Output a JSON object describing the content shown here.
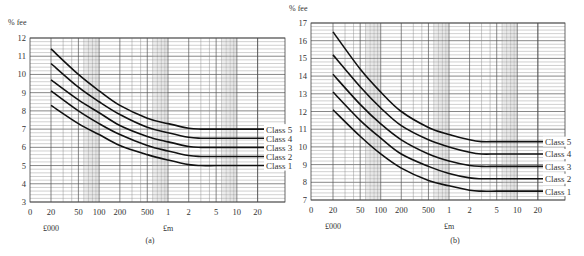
{
  "chart_data": [
    {
      "type": "line",
      "panel_label": "(a)",
      "ylabel": "% fee",
      "xlabel_left": "£000",
      "xlabel_right": "£m",
      "x_scale": "log",
      "x_ticks": [
        "0",
        "20",
        "50",
        "100",
        "200",
        "500",
        "1",
        "2",
        "5",
        "10",
        "20"
      ],
      "x_values_gbp": [
        0,
        20000,
        50000,
        100000,
        200000,
        500000,
        1000000,
        2000000,
        5000000,
        10000000,
        20000000
      ],
      "ylim": [
        3,
        12
      ],
      "y_ticks": [
        3,
        4,
        5,
        6,
        7,
        8,
        9,
        10,
        11,
        12
      ],
      "grid": true,
      "legend_position": "right, inline labels",
      "x": [
        20000,
        50000,
        100000,
        200000,
        500000,
        1000000,
        2000000,
        3000000,
        5000000,
        10000000
      ],
      "series": [
        {
          "name": "Class 5",
          "values": [
            11.4,
            10.0,
            9.1,
            8.3,
            7.6,
            7.3,
            7.05,
            7.0,
            7.0,
            7.0
          ]
        },
        {
          "name": "Class 4",
          "values": [
            10.6,
            9.3,
            8.5,
            7.8,
            7.1,
            6.8,
            6.55,
            6.5,
            6.5,
            6.5
          ]
        },
        {
          "name": "Class 3",
          "values": [
            9.7,
            8.6,
            7.9,
            7.2,
            6.6,
            6.3,
            6.05,
            6.0,
            6.0,
            6.0
          ]
        },
        {
          "name": "Class 2",
          "values": [
            9.1,
            8.0,
            7.3,
            6.7,
            6.1,
            5.8,
            5.55,
            5.5,
            5.5,
            5.5
          ]
        },
        {
          "name": "Class 1",
          "values": [
            8.3,
            7.3,
            6.7,
            6.1,
            5.6,
            5.3,
            5.05,
            5.0,
            5.0,
            5.0
          ]
        }
      ]
    },
    {
      "type": "line",
      "panel_label": "(b)",
      "ylabel": "% fee",
      "xlabel_left": "£000",
      "xlabel_right": "£m",
      "x_scale": "log",
      "x_ticks": [
        "0",
        "20",
        "50",
        "100",
        "200",
        "500",
        "1",
        "2",
        "5",
        "10",
        "20"
      ],
      "x_values_gbp": [
        0,
        20000,
        50000,
        100000,
        200000,
        500000,
        1000000,
        2000000,
        5000000,
        10000000,
        20000000
      ],
      "ylim": [
        7,
        17
      ],
      "y_ticks": [
        7,
        8,
        9,
        10,
        11,
        12,
        13,
        14,
        15,
        16,
        17
      ],
      "grid": true,
      "legend_position": "right, inline labels",
      "x": [
        20000,
        50000,
        100000,
        200000,
        500000,
        1000000,
        2000000,
        3000000,
        5000000,
        10000000
      ],
      "series": [
        {
          "name": "Class 5",
          "values": [
            16.5,
            14.4,
            13.1,
            12.0,
            11.1,
            10.7,
            10.4,
            10.3,
            10.3,
            10.3
          ]
        },
        {
          "name": "Class 4",
          "values": [
            15.2,
            13.4,
            12.2,
            11.2,
            10.4,
            10.0,
            9.7,
            9.6,
            9.6,
            9.6
          ]
        },
        {
          "name": "Class 3",
          "values": [
            14.1,
            12.4,
            11.3,
            10.4,
            9.6,
            9.2,
            8.95,
            8.9,
            8.9,
            8.9
          ]
        },
        {
          "name": "Class 2",
          "values": [
            13.1,
            11.5,
            10.5,
            9.6,
            8.9,
            8.5,
            8.25,
            8.2,
            8.2,
            8.2
          ]
        },
        {
          "name": "Class 1",
          "values": [
            12.1,
            10.6,
            9.6,
            8.8,
            8.1,
            7.8,
            7.55,
            7.5,
            7.5,
            7.5
          ]
        }
      ]
    }
  ]
}
